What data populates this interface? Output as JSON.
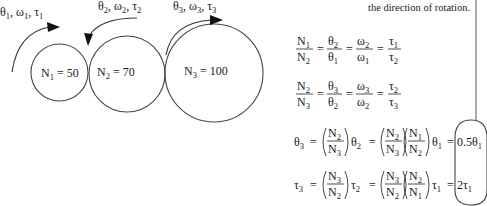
{
  "note": {
    "text": "the direction of rotation."
  },
  "gears": [
    {
      "label": "N",
      "sub": "1",
      "eq": "= 50",
      "teeth": 50
    },
    {
      "label": "N",
      "sub": "2",
      "eq": "= 70",
      "teeth": 70
    },
    {
      "label": "N",
      "sub": "3",
      "eq": "= 100",
      "teeth": 100
    }
  ],
  "rotation_labels": [
    {
      "theta": "θ",
      "omega": "ω",
      "tau": "τ",
      "sub": "1"
    },
    {
      "theta": "θ",
      "omega": "ω",
      "tau": "τ",
      "sub": "2"
    },
    {
      "theta": "θ",
      "omega": "ω",
      "tau": "τ",
      "sub": "3"
    }
  ],
  "equations": {
    "ratio_12": {
      "terms": [
        {
          "num": "N",
          "num_sub": "1",
          "den": "N",
          "den_sub": "2"
        },
        {
          "num": "θ",
          "num_sub": "2",
          "den": "θ",
          "den_sub": "1"
        },
        {
          "num": "ω",
          "num_sub": "2",
          "den": "ω",
          "den_sub": "1"
        },
        {
          "num": "τ",
          "num_sub": "1",
          "den": "τ",
          "den_sub": "2"
        }
      ],
      "op": "="
    },
    "ratio_23": {
      "terms": [
        {
          "num": "N",
          "num_sub": "2",
          "den": "N",
          "den_sub": "3"
        },
        {
          "num": "θ",
          "num_sub": "3",
          "den": "θ",
          "den_sub": "2"
        },
        {
          "num": "ω",
          "num_sub": "3",
          "den": "ω",
          "den_sub": "2"
        },
        {
          "num": "τ",
          "num_sub": "2",
          "den": "τ",
          "den_sub": "3"
        }
      ],
      "op": "="
    },
    "theta3": {
      "lhs": "θ",
      "lhs_sub": "3",
      "f1": {
        "num": "N",
        "num_sub": "2",
        "den": "N",
        "den_sub": "3"
      },
      "v1": "θ",
      "v1_sub": "2",
      "f2": {
        "num": "N",
        "num_sub": "2",
        "den": "N",
        "den_sub": "3"
      },
      "f3": {
        "num": "N",
        "num_sub": "1",
        "den": "N",
        "den_sub": "2"
      },
      "v2": "θ",
      "v2_sub": "1",
      "result": "0.5θ",
      "result_sub": "1",
      "op": "="
    },
    "tau3": {
      "lhs": "τ",
      "lhs_sub": "3",
      "f1": {
        "num": "N",
        "num_sub": "3",
        "den": "N",
        "den_sub": "2"
      },
      "v1": "τ",
      "v1_sub": "2",
      "f2": {
        "num": "N",
        "num_sub": "3",
        "den": "N",
        "den_sub": "2"
      },
      "f3": {
        "num": "N",
        "num_sub": "2",
        "den": "N",
        "den_sub": "1"
      },
      "v2": "τ",
      "v2_sub": "1",
      "result": "2τ",
      "result_sub": "1",
      "op": "="
    }
  },
  "colors": {
    "background": "#ffffff",
    "stroke": "#444444",
    "text": "#1a1a1a"
  }
}
